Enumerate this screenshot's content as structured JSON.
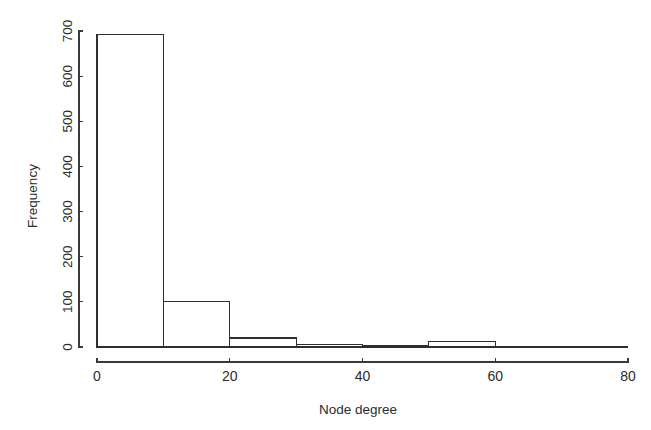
{
  "figure": {
    "kind": "histogram",
    "background_color": "#ffffff",
    "line_color": "#2e2e2e",
    "text_color": "#2b2b2b",
    "width": 651,
    "height": 430
  },
  "axes": {
    "x": {
      "title": "Node degree",
      "tick_labels": [
        "0",
        "20",
        "40",
        "60",
        "80"
      ],
      "tick_values": [
        0,
        20,
        40,
        60,
        80
      ],
      "range": [
        0,
        80
      ]
    },
    "y": {
      "title": "Frequency",
      "tick_labels": [
        "0",
        "100",
        "200",
        "300",
        "400",
        "500",
        "600",
        "700"
      ],
      "tick_values": [
        0,
        100,
        200,
        300,
        400,
        500,
        600,
        700
      ],
      "range": [
        0,
        700
      ],
      "title_rotation": -90
    }
  },
  "chart_data": {
    "type": "bar",
    "title": "",
    "xlabel": "Node degree",
    "ylabel": "Frequency",
    "xlim": [
      0,
      80
    ],
    "ylim": [
      0,
      700
    ],
    "grid": false,
    "legend": false,
    "bin_width": 10,
    "bin_edges": [
      0,
      10,
      20,
      30,
      40,
      50,
      60,
      70,
      80
    ],
    "categories": [
      "0-10",
      "10-20",
      "20-30",
      "30-40",
      "40-50",
      "50-60",
      "60-70",
      "70-80"
    ],
    "values": [
      693,
      101,
      20,
      6,
      3,
      13,
      2,
      1
    ],
    "bars": [
      {
        "label": "0-10",
        "x0": 0,
        "x1": 10,
        "value": 693
      },
      {
        "label": "10-20",
        "x0": 10,
        "x1": 20,
        "value": 101
      },
      {
        "label": "20-30",
        "x0": 20,
        "x1": 30,
        "value": 20
      },
      {
        "label": "30-40",
        "x0": 30,
        "x1": 40,
        "value": 6
      },
      {
        "label": "40-50",
        "x0": 40,
        "x1": 50,
        "value": 3
      },
      {
        "label": "50-60",
        "x0": 50,
        "x1": 60,
        "value": 13
      },
      {
        "label": "60-70",
        "x0": 60,
        "x1": 70,
        "value": 2
      },
      {
        "label": "70-80",
        "x0": 70,
        "x1": 80,
        "value": 1
      }
    ]
  }
}
